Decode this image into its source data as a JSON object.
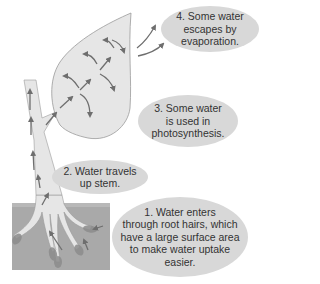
{
  "diagram": {
    "colors": {
      "soil": "#a9a9a9",
      "plant_fill": "#e6e6e6",
      "plant_outline": "#9a9a9a",
      "arrow": "#6e6e6e",
      "bubble": "#d8d8d8",
      "text": "#333333",
      "root_hair": "#8c8c8c"
    },
    "labels": [
      {
        "id": "step-1",
        "lines": [
          "1. Water enters",
          "through root hairs, which",
          "have a large surface area",
          "to make water uptake",
          "easier."
        ]
      },
      {
        "id": "step-2",
        "lines": [
          "2. Water travels",
          "up stem."
        ]
      },
      {
        "id": "step-3",
        "lines": [
          "3. Some water",
          "is used in",
          "photosynthesis."
        ]
      },
      {
        "id": "step-4",
        "lines": [
          "4. Some water",
          "escapes by",
          "evaporation."
        ]
      }
    ],
    "regions": [
      "soil",
      "roots",
      "stem",
      "leaf"
    ]
  }
}
